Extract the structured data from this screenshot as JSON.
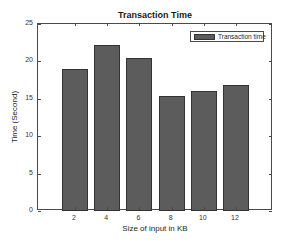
{
  "chart_data": {
    "type": "bar",
    "title": "Transaction Time",
    "xlabel": "Size of input in KB",
    "ylabel": "Time (Second)",
    "categories": [
      "2",
      "4",
      "6",
      "8",
      "10",
      "12"
    ],
    "x": [
      2,
      4,
      6,
      8,
      10,
      12
    ],
    "series": [
      {
        "name": "Transaction time",
        "values": [
          19.0,
          22.2,
          20.5,
          15.4,
          16.0,
          16.9
        ],
        "color": "#5c5c5c"
      }
    ],
    "ylim": [
      0,
      25
    ],
    "xlim": [
      -0.3,
      14.3
    ],
    "yticks": [
      0,
      5,
      10,
      15,
      20,
      25
    ],
    "xticks": [
      2,
      4,
      6,
      8,
      10,
      12
    ],
    "grid": false,
    "legend_position": "upper right"
  }
}
